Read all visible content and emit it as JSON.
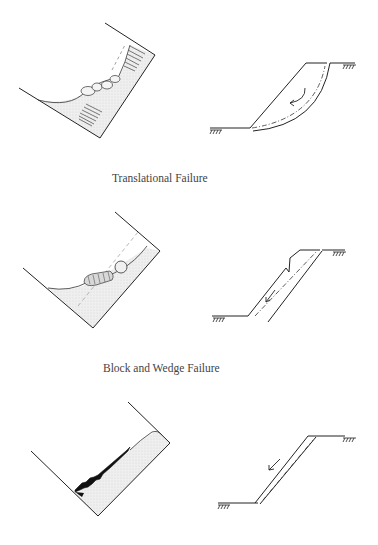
{
  "figure": {
    "panels": [
      {
        "id": "rotational",
        "left_sketch": "curved-slope-with-rotational-slump",
        "right_sketch": "slope-with-circular-slip-surface-and-rotation-arrow",
        "caption": ""
      },
      {
        "id": "translational",
        "left_sketch": "slope-with-block-sliding-on-plane",
        "right_sketch": "slope-with-planar-slip-and-down-slope-arrow",
        "caption": "Translational Failure"
      },
      {
        "id": "block-wedge",
        "left_sketch": "slope-with-stepped-black-wedge-blocks",
        "right_sketch": "slope-with-thin-parallel-slab-and-arrow",
        "caption": "Block and Wedge Failure"
      }
    ],
    "colors": {
      "line": "#222222",
      "fill": "#e8e8e8",
      "caption": "#444444"
    }
  }
}
